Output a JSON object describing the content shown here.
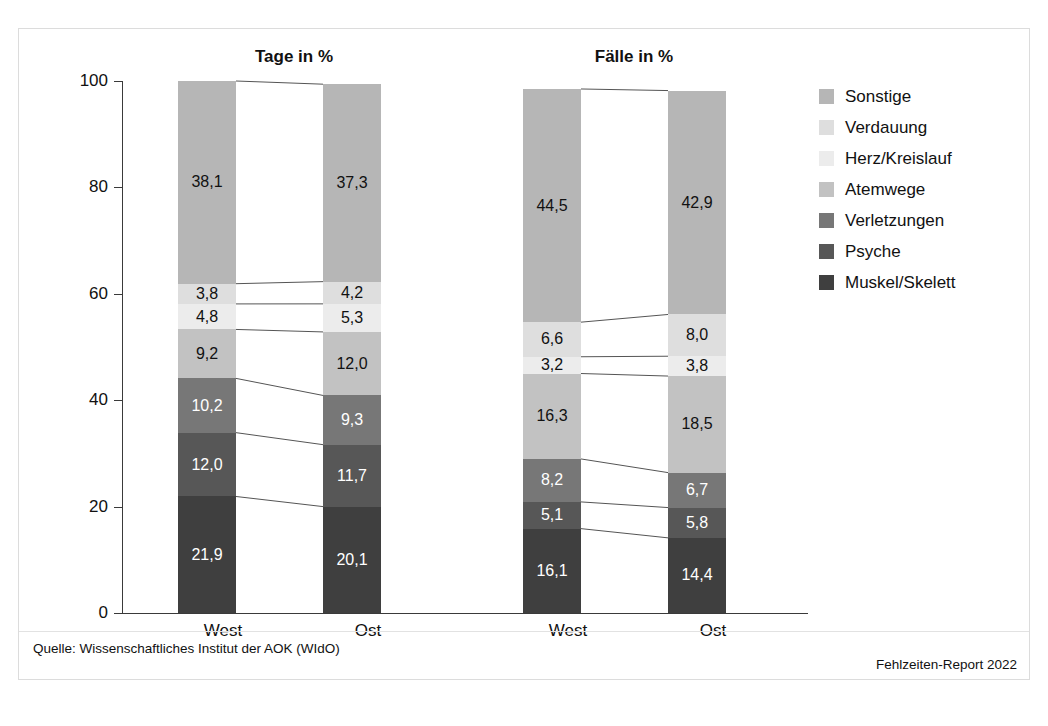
{
  "chart_data": {
    "type": "bar",
    "subtype": "stacked-100-percent",
    "title": "",
    "panels": [
      {
        "title": "Tage in %",
        "categories": [
          "West",
          "Ost"
        ],
        "totals": [
          100.0,
          99.4
        ]
      },
      {
        "title": "Fälle in %",
        "categories": [
          "West",
          "Ost"
        ],
        "totals": [
          98.5,
          98.2
        ]
      }
    ],
    "categories": [
      "Tage West",
      "Tage Ost",
      "Fälle West",
      "Fälle Ost"
    ],
    "series": [
      {
        "name": "Muskel/Skelett",
        "color": "#3f3f3f",
        "values": [
          21.9,
          20.1,
          16.1,
          14.4
        ],
        "labels": [
          "21,9",
          "20,1",
          "16,1",
          "14,4"
        ],
        "label_color": "light"
      },
      {
        "name": "Psyche",
        "color": "#575757",
        "values": [
          12.0,
          11.7,
          5.1,
          5.8
        ],
        "labels": [
          "12,0",
          "11,7",
          "5,1",
          "5,8"
        ],
        "label_color": "light"
      },
      {
        "name": "Verletzungen",
        "color": "#777777",
        "values": [
          10.2,
          9.3,
          8.2,
          6.7
        ],
        "labels": [
          "10,2",
          "9,3",
          "8,2",
          "6,7"
        ],
        "label_color": "light"
      },
      {
        "name": "Atemwege",
        "color": "#c2c2c2",
        "values": [
          9.2,
          12.0,
          16.3,
          18.5
        ],
        "labels": [
          "9,2",
          "12,0",
          "16,3",
          "18,5"
        ],
        "label_color": "dark"
      },
      {
        "name": "Herz/Kreislauf",
        "color": "#ececec",
        "values": [
          4.8,
          5.3,
          3.2,
          3.8
        ],
        "labels": [
          "4,8",
          "5,3",
          "3,2",
          "3,8"
        ],
        "label_color": "dark"
      },
      {
        "name": "Verdauung",
        "color": "#dedede",
        "values": [
          3.8,
          4.2,
          6.6,
          8.0
        ],
        "labels": [
          "3,8",
          "4,2",
          "6,6",
          "8,0"
        ],
        "label_color": "dark"
      },
      {
        "name": "Sonstige",
        "color": "#b6b6b6",
        "values": [
          38.1,
          37.3,
          44.5,
          42.9
        ],
        "labels": [
          "38,1",
          "37,3",
          "44,5",
          "42,9"
        ],
        "label_color": "dark"
      }
    ],
    "ylabel": "",
    "xlabel": "",
    "ylim": [
      0,
      100
    ],
    "yticks": [
      0,
      20,
      40,
      60,
      80,
      100
    ],
    "ytick_labels": [
      "0",
      "20",
      "40",
      "60",
      "80",
      "100"
    ],
    "grid": false,
    "legend_position": "right"
  },
  "panels": {
    "left_title": "Tage in %",
    "right_title": "Fälle in %"
  },
  "axis": {
    "ytick_labels": [
      "100",
      "80",
      "60",
      "40",
      "20",
      "0"
    ]
  },
  "categories": {
    "tage_west": "West",
    "tage_ost": "Ost",
    "faelle_west": "West",
    "faelle_ost": "Ost"
  },
  "legend": {
    "items": [
      {
        "label": "Sonstige",
        "color": "#b6b6b6"
      },
      {
        "label": "Verdauung",
        "color": "#dedede"
      },
      {
        "label": "Herz/Kreislauf",
        "color": "#ececec"
      },
      {
        "label": "Atemwege",
        "color": "#c2c2c2"
      },
      {
        "label": "Verletzungen",
        "color": "#777777"
      },
      {
        "label": "Psyche",
        "color": "#575757"
      },
      {
        "label": "Muskel/Skelett",
        "color": "#3f3f3f"
      }
    ]
  },
  "footer": {
    "source": "Quelle: Wissenschaftliches Institut der AOK (WIdO)",
    "report": "Fehlzeiten-Report 2022"
  }
}
